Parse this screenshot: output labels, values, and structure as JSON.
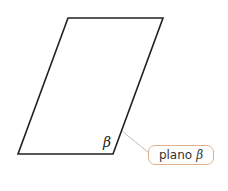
{
  "figure": {
    "plane_symbol": "β",
    "callout": {
      "text": "plano",
      "symbol": "β"
    },
    "colors": {
      "outline": "#231f20",
      "leader_line": "#bdbdbd",
      "callout_border": "#e0b08a"
    }
  }
}
